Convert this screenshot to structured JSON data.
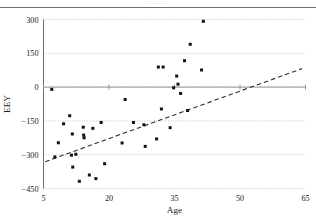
{
  "page": {
    "header_fragment": "· · · · · ·",
    "rule": "horizontal-rule"
  },
  "chart_data": {
    "type": "scatter",
    "title": "",
    "xlabel": "Age",
    "ylabel": "EEY",
    "xlim": [
      5,
      65
    ],
    "ylim": [
      -450,
      300
    ],
    "xticks": [
      5,
      20,
      35,
      50,
      65
    ],
    "xtick_labels": [
      "5",
      "20",
      "35",
      "50",
      "65"
    ],
    "yticks": [
      300,
      150,
      0,
      -150,
      -300,
      -450
    ],
    "ytick_labels": [
      "300",
      "150",
      "0",
      "−150",
      "−300",
      "−450"
    ],
    "grid": true,
    "grid_style": "dotted",
    "zero_line": true,
    "legend": "none",
    "marker": "filled-square",
    "marker_color": "#111111",
    "points": [
      {
        "x": 6.9,
        "y": -10
      },
      {
        "x": 7.6,
        "y": -310
      },
      {
        "x": 8.4,
        "y": -247
      },
      {
        "x": 9.6,
        "y": -163
      },
      {
        "x": 11.0,
        "y": -127
      },
      {
        "x": 11.4,
        "y": -302
      },
      {
        "x": 11.6,
        "y": -208
      },
      {
        "x": 11.7,
        "y": -355
      },
      {
        "x": 12.4,
        "y": -298
      },
      {
        "x": 13.2,
        "y": -418
      },
      {
        "x": 14.1,
        "y": -178
      },
      {
        "x": 14.2,
        "y": -213
      },
      {
        "x": 14.3,
        "y": -225
      },
      {
        "x": 15.5,
        "y": -390
      },
      {
        "x": 16.3,
        "y": -183
      },
      {
        "x": 17.0,
        "y": -406
      },
      {
        "x": 18.2,
        "y": -157
      },
      {
        "x": 19.0,
        "y": -340
      },
      {
        "x": 23.0,
        "y": -248
      },
      {
        "x": 23.7,
        "y": -55
      },
      {
        "x": 25.6,
        "y": -157
      },
      {
        "x": 28.0,
        "y": -167
      },
      {
        "x": 28.3,
        "y": -263
      },
      {
        "x": 30.9,
        "y": -230
      },
      {
        "x": 31.3,
        "y": 89
      },
      {
        "x": 32.0,
        "y": -97
      },
      {
        "x": 32.4,
        "y": 89
      },
      {
        "x": 34.0,
        "y": -180
      },
      {
        "x": 34.8,
        "y": -3
      },
      {
        "x": 35.5,
        "y": 49
      },
      {
        "x": 35.8,
        "y": 13
      },
      {
        "x": 36.4,
        "y": -28
      },
      {
        "x": 37.3,
        "y": 117
      },
      {
        "x": 38.0,
        "y": -104
      },
      {
        "x": 38.6,
        "y": 190
      },
      {
        "x": 41.2,
        "y": 76
      },
      {
        "x": 41.6,
        "y": 292
      }
    ],
    "fit_line": {
      "style": "dashed",
      "color": "#2b2b2b",
      "x_start": 5.4,
      "y_start": -331,
      "x_end": 64.2,
      "y_end": 82
    }
  }
}
